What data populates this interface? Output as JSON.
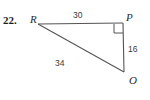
{
  "problem": {
    "number": "22."
  },
  "figure": {
    "type": "right-triangle",
    "vertices": [
      {
        "id": "R",
        "label": "R",
        "x": 38,
        "y": 24
      },
      {
        "id": "P",
        "label": "P",
        "x": 123,
        "y": 23
      },
      {
        "id": "O",
        "label": "O",
        "x": 124,
        "y": 72
      }
    ],
    "sides": [
      {
        "id": "RP",
        "from": "R",
        "to": "P",
        "length_label": "30"
      },
      {
        "id": "PO",
        "from": "P",
        "to": "O",
        "length_label": "16"
      },
      {
        "id": "RO",
        "from": "R",
        "to": "O",
        "length_label": "34"
      }
    ],
    "right_angle_at": "P",
    "stroke_color": "#555555",
    "text_color": "#2a2a2a"
  }
}
